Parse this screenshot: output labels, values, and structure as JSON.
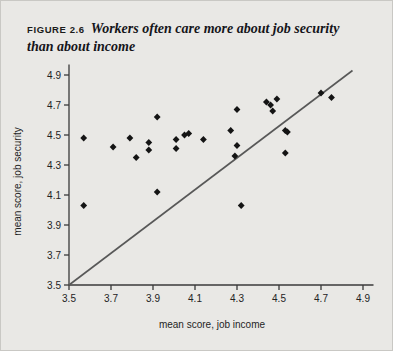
{
  "figure": {
    "number_label": "FIGURE 2.6",
    "caption": "Workers often care more about job security than about income"
  },
  "colors": {
    "background": "#e9e8e5",
    "frame_border": "#c9c8c4",
    "axis": "#3a3a3a",
    "marker": "#141414",
    "reference_line": "#585858",
    "text": "#1f1f1f"
  },
  "chart_data": {
    "type": "scatter",
    "title": "Workers often care more about job security than about income",
    "xlabel": "mean score, job income",
    "ylabel": "mean score, job security",
    "xlim": [
      3.5,
      5.0
    ],
    "ylim": [
      3.5,
      5.0
    ],
    "xticks": [
      "3.5",
      "3.7",
      "3.9",
      "4.1",
      "4.3",
      "4.5",
      "4.7",
      "4.9"
    ],
    "yticks": [
      "3.5",
      "3.7",
      "3.9",
      "4.1",
      "4.3",
      "4.5",
      "4.7",
      "4.9"
    ],
    "grid": false,
    "legend": null,
    "annotations": [
      {
        "name": "identity-reference-line",
        "description": "45-degree line where job income equals job security",
        "x": [
          3.5,
          4.85
        ],
        "y": [
          3.5,
          4.93
        ]
      }
    ],
    "points": [
      {
        "x": 3.57,
        "y": 4.48
      },
      {
        "x": 3.57,
        "y": 4.03
      },
      {
        "x": 3.71,
        "y": 4.42
      },
      {
        "x": 3.79,
        "y": 4.48
      },
      {
        "x": 3.82,
        "y": 4.35
      },
      {
        "x": 3.88,
        "y": 4.45
      },
      {
        "x": 3.88,
        "y": 4.4
      },
      {
        "x": 3.92,
        "y": 4.62
      },
      {
        "x": 3.92,
        "y": 4.12
      },
      {
        "x": 4.01,
        "y": 4.47
      },
      {
        "x": 4.01,
        "y": 4.41
      },
      {
        "x": 4.05,
        "y": 4.5
      },
      {
        "x": 4.07,
        "y": 4.51
      },
      {
        "x": 4.14,
        "y": 4.47
      },
      {
        "x": 4.27,
        "y": 4.53
      },
      {
        "x": 4.3,
        "y": 4.67
      },
      {
        "x": 4.3,
        "y": 4.43
      },
      {
        "x": 4.29,
        "y": 4.36
      },
      {
        "x": 4.32,
        "y": 4.03
      },
      {
        "x": 4.44,
        "y": 4.72
      },
      {
        "x": 4.46,
        "y": 4.7
      },
      {
        "x": 4.47,
        "y": 4.66
      },
      {
        "x": 4.49,
        "y": 4.74
      },
      {
        "x": 4.53,
        "y": 4.53
      },
      {
        "x": 4.54,
        "y": 4.52
      },
      {
        "x": 4.53,
        "y": 4.38
      },
      {
        "x": 4.7,
        "y": 4.78
      },
      {
        "x": 4.75,
        "y": 4.75
      }
    ]
  }
}
